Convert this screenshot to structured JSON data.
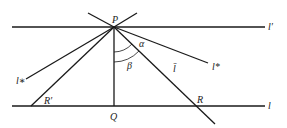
{
  "diagram": {
    "points": {
      "P": {
        "label": "P",
        "x": 114,
        "y": 27
      },
      "Q": {
        "label": "Q",
        "x": 114,
        "y": 106
      },
      "R": {
        "label": "R",
        "x": 195,
        "y": 106
      },
      "R_prime": {
        "label": "R′",
        "x": 31,
        "y": 106
      }
    },
    "lines": {
      "l_prime": {
        "label": "l′"
      },
      "l": {
        "label": "l"
      },
      "l_bar": {
        "label": "l̄"
      },
      "l_star_upper": {
        "label": "l*"
      },
      "l_star_lower": {
        "label": "l∗"
      }
    },
    "angles": {
      "alpha": {
        "label": "α"
      },
      "beta": {
        "label": "β"
      }
    }
  }
}
